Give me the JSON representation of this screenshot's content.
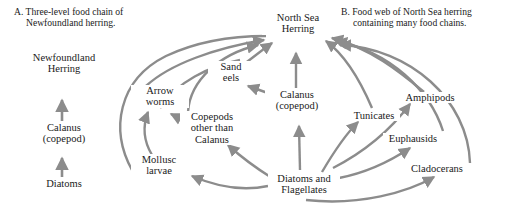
{
  "figure": {
    "title_a": "A.  Three-level food chain of",
    "title_a_line2": "Newfoundland herring.",
    "title_b": "B.  Food web of North Sea herring",
    "title_b_line2": "containing many food chains.",
    "panel_a_nodes": [
      {
        "id": "nf-herring",
        "line1": "Newfoundland",
        "line2": "Herring"
      },
      {
        "id": "calanus-a",
        "line1": "Calanus",
        "line2": "(copepod)"
      },
      {
        "id": "diatoms-a",
        "line1": "Diatoms",
        "line2": ""
      }
    ],
    "panel_b_nodes": [
      {
        "id": "north-sea-herring",
        "line1": "North Sea",
        "line2": "Herring"
      },
      {
        "id": "sand-eels",
        "line1": "Sand",
        "line2": "eels"
      },
      {
        "id": "arrow-worms",
        "line1": "Arrow",
        "line2": "worms"
      },
      {
        "id": "copepods-other",
        "line1": "Copepods",
        "line2": "other than",
        "line3": "Calanus"
      },
      {
        "id": "mollusc-larvae",
        "line1": "Mollusc",
        "line2": "larvae"
      },
      {
        "id": "calanus-b",
        "line1": "Calanus",
        "line2": "(copepod)"
      },
      {
        "id": "tunicates",
        "line1": "Tunicates",
        "line2": ""
      },
      {
        "id": "amphipods",
        "line1": "Amphipods",
        "line2": ""
      },
      {
        "id": "euphausids",
        "line1": "Euphausids",
        "line2": ""
      },
      {
        "id": "cladocerans",
        "line1": "Cladocerans",
        "line2": ""
      },
      {
        "id": "diatoms-flagellates",
        "line1": "Diatoms and",
        "line2": "Flagellates"
      }
    ],
    "arrow_color": "#8c8c8c",
    "text_color": "#1a1a1a",
    "background_color": "#ffffff",
    "edges_panel_a": [
      {
        "from": "diatoms-a",
        "to": "calanus-a"
      },
      {
        "from": "calanus-a",
        "to": "nf-herring"
      }
    ],
    "edges_panel_b": [
      {
        "from": "sand-eels",
        "to": "north-sea-herring"
      },
      {
        "from": "arrow-worms",
        "to": "north-sea-herring"
      },
      {
        "from": "copepods-other",
        "to": "north-sea-herring"
      },
      {
        "from": "calanus-b",
        "to": "north-sea-herring"
      },
      {
        "from": "tunicates",
        "to": "north-sea-herring"
      },
      {
        "from": "amphipods",
        "to": "north-sea-herring"
      },
      {
        "from": "euphausids",
        "to": "north-sea-herring"
      },
      {
        "from": "cladocerans",
        "to": "north-sea-herring"
      },
      {
        "from": "calanus-b",
        "to": "sand-eels"
      },
      {
        "from": "copepods-other",
        "to": "arrow-worms"
      },
      {
        "from": "mollusc-larvae",
        "to": "arrow-worms"
      },
      {
        "from": "diatoms-flagellates",
        "to": "mollusc-larvae"
      },
      {
        "from": "diatoms-flagellates",
        "to": "copepods-other"
      },
      {
        "from": "diatoms-flagellates",
        "to": "calanus-b"
      },
      {
        "from": "diatoms-flagellates",
        "to": "tunicates"
      },
      {
        "from": "diatoms-flagellates",
        "to": "euphausids"
      },
      {
        "from": "diatoms-flagellates",
        "to": "cladocerans"
      },
      {
        "from": "diatoms-flagellates",
        "to": "amphipods"
      }
    ]
  }
}
